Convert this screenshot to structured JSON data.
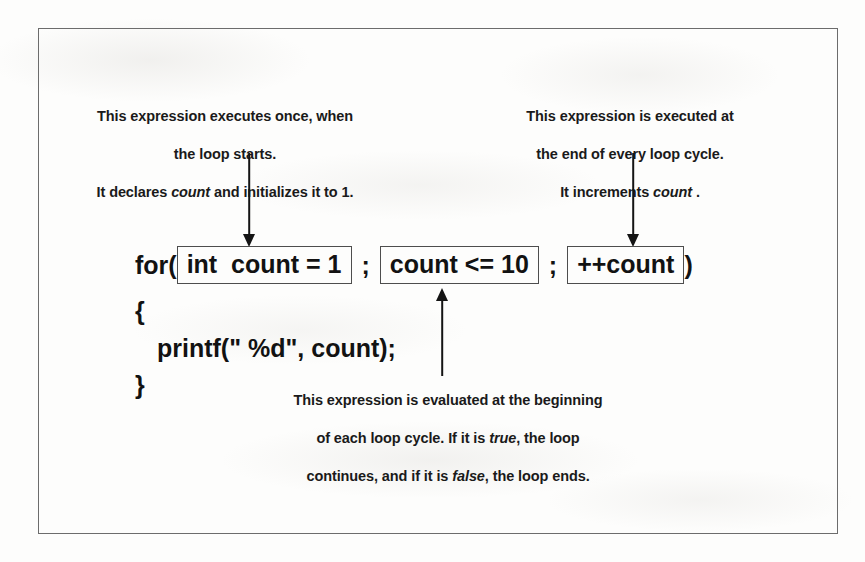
{
  "figure": {
    "kind": "annotated-code-diagram",
    "border_color": "#6c6c6c",
    "text_color": "#1a1a1a",
    "background_color": "#fdfdfc"
  },
  "annotations": {
    "init": {
      "line1": "This expression executes once, when",
      "line2": "the loop starts.",
      "line3_pre": "It declares ",
      "line3_em": "count",
      "line3_post": " and initializes it to 1.",
      "points_to": "init-expression-box"
    },
    "increment": {
      "line1": "This expression is executed at",
      "line2": "the end of every loop cycle.",
      "line3_pre": "It increments ",
      "line3_em": "count",
      "line3_post": " .",
      "points_to": "increment-expression-box"
    },
    "condition": {
      "line1": "This expression is evaluated at the beginning",
      "line2_pre": "of each loop cycle. If it is ",
      "line2_em": "true",
      "line2_post": ", the loop",
      "line3_pre": "continues, and if it is ",
      "line3_em": "false",
      "line3_post": ", the loop ends.",
      "points_to": "condition-expression-box"
    }
  },
  "code": {
    "for_keyword": "for(",
    "init_expression": "int  count = 1",
    "separator_1": ";",
    "condition_expression": "count <= 10",
    "separator_2": ";",
    "increment_expression": "++count",
    "close_paren": ")",
    "brace_open": "{",
    "body_statement": "printf(\" %d\", count);",
    "brace_close": "}"
  },
  "arrows": {
    "init_arrow": "arrow-down",
    "increment_arrow": "arrow-down",
    "condition_arrow": "arrow-up"
  }
}
